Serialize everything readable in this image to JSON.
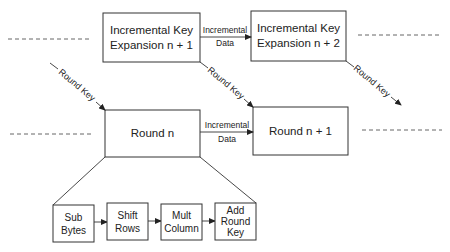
{
  "diagram": {
    "key_expansion_boxes": [
      {
        "id": "kexp-n1",
        "lines": [
          "Incremental Key",
          "Expansion n + 1"
        ]
      },
      {
        "id": "kexp-n2",
        "lines": [
          "Incremental Key",
          "Expansion n + 2"
        ]
      }
    ],
    "round_boxes": [
      {
        "id": "round-n",
        "label": "Round n"
      },
      {
        "id": "round-n1",
        "label": "Round n + 1"
      }
    ],
    "edge_labels": {
      "incremental_data_top": [
        "Incremental",
        "Data"
      ],
      "incremental_data_bottom": [
        "Incremental",
        "Data"
      ],
      "round_key": "Round Key"
    },
    "round_operations": [
      {
        "id": "sub-bytes",
        "lines": [
          "Sub",
          "Bytes"
        ]
      },
      {
        "id": "shift-rows",
        "lines": [
          "Shift",
          "Rows"
        ]
      },
      {
        "id": "mult-column",
        "lines": [
          "Mult",
          "Column"
        ]
      },
      {
        "id": "add-round-key",
        "lines": [
          "Add",
          "Round",
          "Key"
        ]
      }
    ]
  }
}
